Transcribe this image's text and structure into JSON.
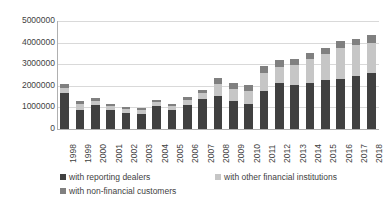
{
  "chart_data": {
    "type": "bar",
    "subtype": "stacked-vertical",
    "title": "",
    "xlabel": "",
    "ylabel": "",
    "grid": true,
    "legend_position": "bottom",
    "ylim": [
      0,
      5000000
    ],
    "ytick_labels": [
      "0",
      "1000000",
      "2000000",
      "3000000",
      "4000000",
      "5000000"
    ],
    "ytick_values": [
      0,
      1000000,
      2000000,
      3000000,
      4000000,
      5000000
    ],
    "categories": [
      "1998",
      "1999",
      "2000",
      "2001",
      "2002",
      "2003",
      "2004",
      "2005",
      "2006",
      "2007",
      "2008",
      "2009",
      "2010",
      "2011",
      "2012",
      "2013",
      "2014",
      "2015",
      "2016",
      "2017",
      "2018"
    ],
    "series": [
      {
        "name": "with reporting dealers",
        "color": "#404040",
        "values": [
          1650000,
          900000,
          1120000,
          870000,
          760000,
          700000,
          1060000,
          890000,
          1130000,
          1370000,
          1540000,
          1280000,
          1180000,
          1750000,
          2150000,
          2020000,
          2140000,
          2260000,
          2330000,
          2450000,
          2600000
        ]
      },
      {
        "name": "with other financial institutions",
        "color": "#c6c6c6",
        "values": [
          230000,
          240000,
          190000,
          180000,
          160000,
          170000,
          190000,
          190000,
          220000,
          300000,
          560000,
          560000,
          590000,
          830000,
          720000,
          940000,
          1120000,
          1210000,
          1440000,
          1420000,
          1400000
        ]
      },
      {
        "name": "with non-financial customers",
        "color": "#808080",
        "values": [
          190000,
          140000,
          120000,
          100000,
          100000,
          90000,
          100000,
          100000,
          140000,
          120000,
          260000,
          300000,
          290000,
          350000,
          310000,
          300000,
          270000,
          290000,
          290000,
          310000,
          330000
        ]
      }
    ]
  },
  "legend": {
    "items": [
      {
        "label": "with reporting dealers",
        "color": "#404040"
      },
      {
        "label": "with other financial institutions",
        "color": "#c6c6c6"
      },
      {
        "label": "with non-financial customers",
        "color": "#808080"
      }
    ]
  }
}
